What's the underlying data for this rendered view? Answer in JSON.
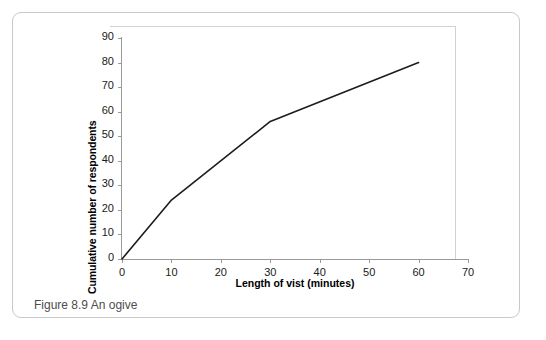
{
  "figure": {
    "caption": "Figure 8.9  An ogive"
  },
  "chart_data": {
    "type": "line",
    "title": "",
    "xlabel": "Length of vist (minutes)",
    "ylabel": "Cumulative number of respondents",
    "x": [
      0,
      10,
      30,
      60
    ],
    "values": [
      0,
      24,
      56,
      80
    ],
    "series": [
      {
        "name": "Cumulative number of respondents",
        "x": [
          0,
          10,
          30,
          60
        ],
        "values": [
          0,
          24,
          56,
          80
        ]
      }
    ],
    "xlim": [
      0,
      70
    ],
    "ylim": [
      0,
      90
    ],
    "xticks": [
      0,
      10,
      20,
      30,
      40,
      50,
      60,
      70
    ],
    "yticks": [
      0,
      10,
      20,
      30,
      40,
      50,
      60,
      70,
      80,
      90
    ],
    "xtick_labels": [
      "0",
      "10",
      "20",
      "30",
      "40",
      "50",
      "60",
      "70"
    ],
    "ytick_labels": [
      "0",
      "10",
      "20",
      "30",
      "40",
      "50",
      "60",
      "70",
      "80",
      "90"
    ],
    "grid": false,
    "legend": false,
    "line_color": "#1c1c1c",
    "axis_color": "#9a9a9a"
  }
}
